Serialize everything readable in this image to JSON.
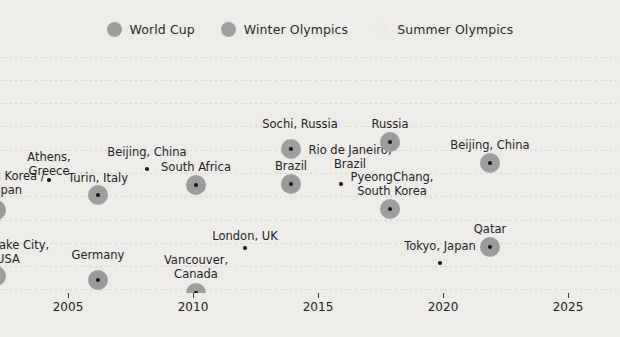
{
  "legend": {
    "items": [
      {
        "label": "World Cup",
        "color": "#9b9b9b",
        "size": 15,
        "icon": "circle-marker-icon"
      },
      {
        "label": "Winter Olympics",
        "color": "#9e9e9e",
        "size": 15,
        "icon": "circle-marker-icon"
      },
      {
        "label": "Summer Olympics",
        "color": "#eceae7",
        "size": 15,
        "icon": "circle-marker-icon"
      }
    ]
  },
  "chart_data": {
    "type": "scatter",
    "title": "",
    "xlabel": "",
    "ylabel": "",
    "xlim": [
      2001,
      2026
    ],
    "grid": true,
    "legend_position": "top-center",
    "xticks": [
      2005,
      2010,
      2015,
      2020,
      2025
    ],
    "xtick_labels": [
      "2005",
      "2010",
      "2015",
      "2020",
      "2025"
    ],
    "series": [
      {
        "name": "World Cup",
        "color": "#9b9b9b",
        "points": [
          {
            "x": 2002,
            "label": "South Korea /\nJapan",
            "clipped": true
          },
          {
            "x": 2006,
            "label": "Germany"
          },
          {
            "x": 2010,
            "label": "South Africa"
          },
          {
            "x": 2014,
            "label": "Brazil"
          },
          {
            "x": 2018,
            "label": "Russia"
          },
          {
            "x": 2022,
            "label": "Qatar"
          }
        ]
      },
      {
        "name": "Winter Olympics",
        "color": "#9e9e9e",
        "points": [
          {
            "x": 2002,
            "label": "Salt Lake City,\nUSA",
            "clipped": true
          },
          {
            "x": 2006,
            "label": "Turin, Italy"
          },
          {
            "x": 2010,
            "label": "Vancouver,\nCanada"
          },
          {
            "x": 2014,
            "label": "Sochi, Russia"
          },
          {
            "x": 2018,
            "label": "PyeongChang,\nSouth Korea"
          },
          {
            "x": 2022,
            "label": "Beijing, China"
          }
        ]
      },
      {
        "name": "Summer Olympics",
        "color": "#eceae7",
        "points": [
          {
            "x": 2004,
            "label": "Athens,\nGreece"
          },
          {
            "x": 2008,
            "label": "Beijing, China"
          },
          {
            "x": 2012,
            "label": "London, UK"
          },
          {
            "x": 2016,
            "label": "Rio de Janeiro,\nBrazil"
          },
          {
            "x": 2020,
            "label": "Tokyo, Japan"
          }
        ]
      }
    ],
    "markers": [
      {
        "series": "Winter Olympics",
        "label": "Salt Lake City,\nUSA",
        "cx": -4,
        "cy": 231,
        "r": 10,
        "label_x": 8,
        "label_y": 194,
        "label_align": "center",
        "clipped": true
      },
      {
        "series": "World Cup",
        "label": "South Korea /\nJapan",
        "cx": -4,
        "cy": 165,
        "r": 10,
        "label_x": 6,
        "label_y": 125,
        "label_align": "center",
        "clipped": true
      },
      {
        "series": "Winter Olympics",
        "label": "Turin, Italy",
        "cx": 98,
        "cy": 150,
        "r": 10,
        "label_x": 98,
        "label_y": 127,
        "label_align": "center"
      },
      {
        "series": "World Cup",
        "label": "Germany",
        "cx": 98,
        "cy": 235,
        "r": 10,
        "label_x": 98,
        "label_y": 204,
        "label_align": "center"
      },
      {
        "series": "Summer Olympics",
        "label": "Athens,\nGreece",
        "cx": 49,
        "cy": 135,
        "r": 7,
        "label_x": 49,
        "label_y": 106,
        "label_align": "center"
      },
      {
        "series": "Summer Olympics",
        "label": "Beijing, China",
        "cx": 147,
        "cy": 124,
        "r": 7,
        "label_x": 147,
        "label_y": 101,
        "label_align": "center"
      },
      {
        "series": "World Cup",
        "label": "South Africa",
        "cx": 196,
        "cy": 140,
        "r": 10,
        "label_x": 196,
        "label_y": 116,
        "label_align": "center"
      },
      {
        "series": "Winter Olympics",
        "label": "Vancouver,\nCanada",
        "cx": 196,
        "cy": 248,
        "r": 10,
        "label_x": 196,
        "label_y": 209,
        "label_align": "center"
      },
      {
        "series": "Summer Olympics",
        "label": "London, UK",
        "cx": 245,
        "cy": 203,
        "r": 7,
        "label_x": 245,
        "label_y": 185,
        "label_align": "center"
      },
      {
        "series": "Winter Olympics",
        "label": "Sochi, Russia",
        "cx": 291,
        "cy": 104,
        "r": 10,
        "label_x": 300,
        "label_y": 73,
        "label_align": "center"
      },
      {
        "series": "World Cup",
        "label": "Brazil",
        "cx": 291,
        "cy": 139,
        "r": 10,
        "label_x": 291,
        "label_y": 115,
        "label_align": "center"
      },
      {
        "series": "Summer Olympics",
        "label": "Rio de Janeiro,\nBrazil",
        "cx": 341,
        "cy": 139,
        "r": 7,
        "label_x": 350,
        "label_y": 99,
        "label_align": "center"
      },
      {
        "series": "World Cup",
        "label": "Russia",
        "cx": 390,
        "cy": 97,
        "r": 10,
        "label_x": 390,
        "label_y": 73,
        "label_align": "center"
      },
      {
        "series": "Winter Olympics",
        "label": "PyeongChang,\nSouth Korea",
        "cx": 390,
        "cy": 164,
        "r": 10,
        "label_x": 392,
        "label_y": 126,
        "label_align": "center"
      },
      {
        "series": "Summer Olympics",
        "label": "Tokyo, Japan",
        "cx": 440,
        "cy": 218,
        "r": 7,
        "label_x": 440,
        "label_y": 195,
        "label_align": "center"
      },
      {
        "series": "Winter Olympics",
        "label": "Beijing, China",
        "cx": 490,
        "cy": 118,
        "r": 10,
        "label_x": 490,
        "label_y": 94,
        "label_align": "center"
      },
      {
        "series": "World Cup",
        "label": "Qatar",
        "cx": 490,
        "cy": 202,
        "r": 10,
        "label_x": 490,
        "label_y": 178,
        "label_align": "center"
      }
    ],
    "gridlines_y": [
      12,
      35,
      58,
      81,
      105,
      128,
      151,
      175,
      198,
      221,
      244
    ],
    "axis_ticks": [
      {
        "label": "2005",
        "x": 68
      },
      {
        "label": "2010",
        "x": 193
      },
      {
        "label": "2015",
        "x": 318
      },
      {
        "label": "2020",
        "x": 443
      },
      {
        "label": "2025",
        "x": 568
      }
    ]
  },
  "colors": {
    "background": "#edece9",
    "grid": "#d6d5d2",
    "text": "#232323",
    "marker_fill": "#9b9b9b",
    "marker_core": "#1d1d1d",
    "summer_fill": "#eceae7"
  }
}
